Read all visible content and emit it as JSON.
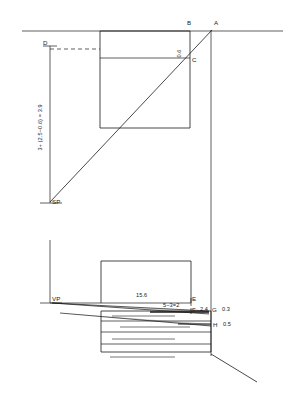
{
  "drawing": {
    "title": "Perspective construction diagram",
    "stroke_color": "#1a1a1a",
    "background_color": "#ffffff",
    "points": {
      "A": "A",
      "B": "B",
      "C": "C",
      "D": "D",
      "E_upper": "E",
      "F": "F",
      "G": "G",
      "H": "H",
      "SP": "SP",
      "VP": "VP"
    },
    "dimensions": {
      "vertical_left": "3+ (2.5−0.6) = 3.9",
      "bc_height": "0.6",
      "horizontal_mid": "15.6",
      "subtraction": "5−3=2",
      "g_left": "2.4",
      "g_right": "0.3",
      "h_right": "0.5"
    }
  }
}
